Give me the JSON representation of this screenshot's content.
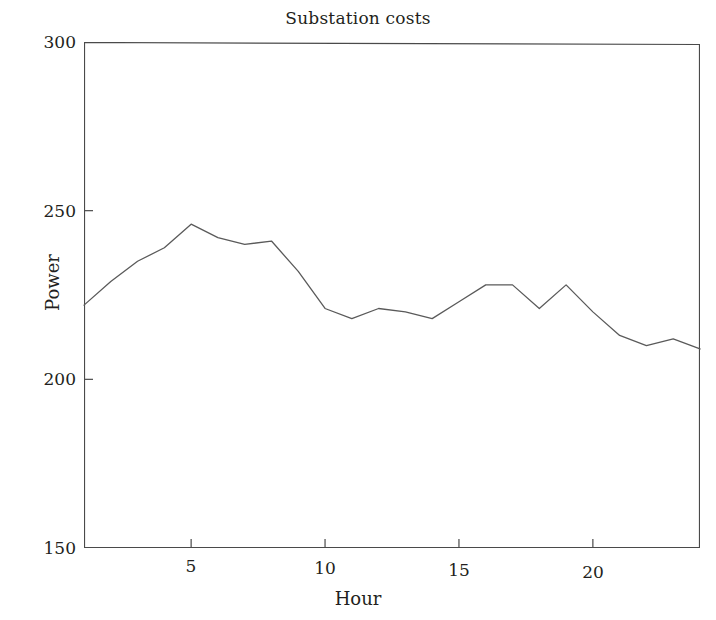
{
  "chart_data": {
    "type": "line",
    "title": "Substation costs",
    "xlabel": "Hour",
    "ylabel": "Power",
    "xlim": [
      1,
      24
    ],
    "ylim": [
      150,
      300
    ],
    "xticks": [
      5,
      10,
      15,
      20
    ],
    "yticks": [
      150,
      200,
      250,
      300
    ],
    "grid": false,
    "legend": null,
    "line_color": "#5a5a5a",
    "x": [
      1,
      2,
      3,
      4,
      5,
      6,
      7,
      8,
      9,
      10,
      11,
      12,
      13,
      14,
      15,
      16,
      17,
      18,
      19,
      20,
      21,
      22,
      23,
      24
    ],
    "values": [
      222,
      229,
      235,
      239,
      246,
      242,
      240,
      241,
      232,
      221,
      218,
      221,
      220,
      218,
      223,
      228,
      228,
      221,
      228,
      220,
      213,
      210,
      212,
      209
    ],
    "series": [
      {
        "name": "Power",
        "values": [
          222,
          229,
          235,
          239,
          246,
          242,
          240,
          241,
          232,
          221,
          218,
          221,
          220,
          218,
          223,
          228,
          228,
          221,
          228,
          220,
          213,
          210,
          212,
          209
        ]
      }
    ]
  },
  "axes": {
    "ytick_labels": [
      "300",
      "250",
      "200",
      "150"
    ],
    "xtick_labels": [
      "5",
      "10",
      "15",
      "20"
    ]
  }
}
